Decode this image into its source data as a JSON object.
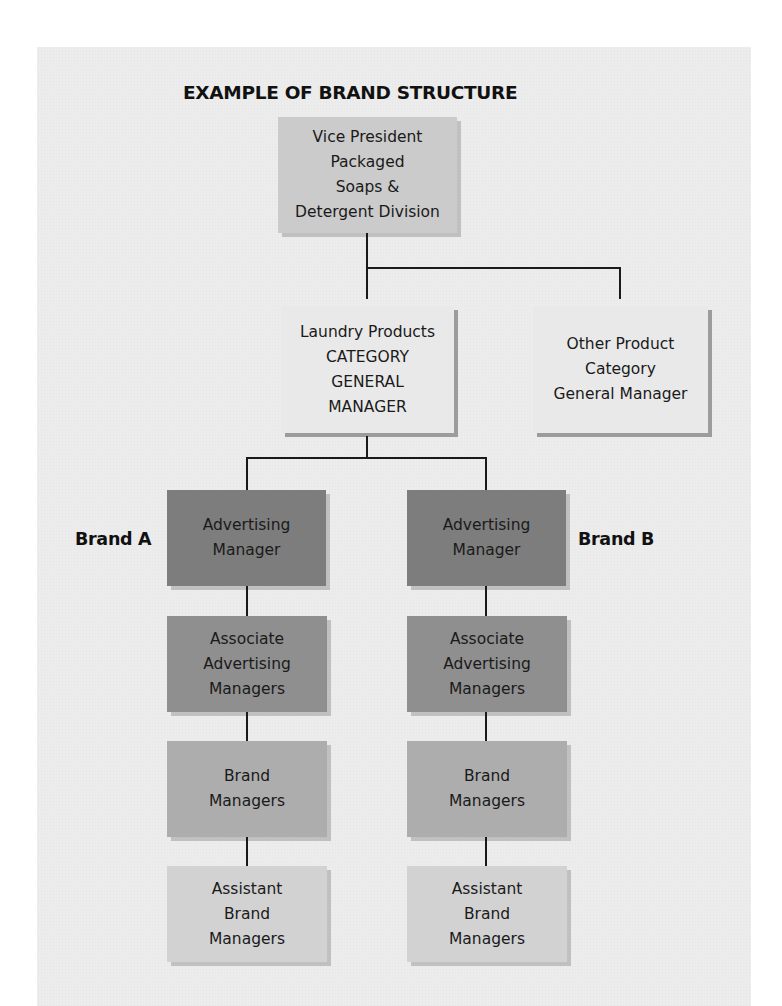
{
  "diagram": {
    "title": "EXAMPLE OF BRAND STRUCTURE",
    "top": {
      "lines": [
        "Vice President",
        "Packaged",
        "Soaps &",
        "Detergent Division"
      ]
    },
    "categories": [
      {
        "lines": [
          "Laundry Products",
          "CATEGORY",
          "GENERAL",
          "MANAGER"
        ]
      },
      {
        "lines": [
          "Other Product",
          "Category",
          "General Manager"
        ]
      }
    ],
    "brands": [
      {
        "label": "Brand A",
        "roles": [
          {
            "lines": [
              "Advertising",
              "Manager"
            ]
          },
          {
            "lines": [
              "Associate",
              "Advertising",
              "Managers"
            ]
          },
          {
            "lines": [
              "Brand",
              "Managers"
            ]
          },
          {
            "lines": [
              "Assistant",
              "Brand",
              "Managers"
            ]
          }
        ]
      },
      {
        "label": "Brand B",
        "roles": [
          {
            "lines": [
              "Advertising",
              "Manager"
            ]
          },
          {
            "lines": [
              "Associate",
              "Advertising",
              "Managers"
            ]
          },
          {
            "lines": [
              "Brand",
              "Managers"
            ]
          },
          {
            "lines": [
              "Assistant",
              "Brand",
              "Managers"
            ]
          }
        ]
      }
    ],
    "colors": {
      "panel_bg": "#ececec",
      "vp_box": "#cbcbcb",
      "category_box": "#e9e9e9",
      "advertising_manager_box": "#7d7d7d",
      "associate_box": "#8f8f8f",
      "brand_manager_box": "#adadad",
      "assistant_box": "#d2d2d2",
      "connector": "#1a1a1a"
    }
  }
}
